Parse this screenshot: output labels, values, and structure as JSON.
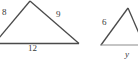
{
  "figure": {
    "kind": "geometry-diagram",
    "background_color": "#ffffff",
    "stroke_color": "#4a4a4a",
    "label_color": "#3a3a3a",
    "triangles": [
      {
        "name": "left-triangle",
        "labels": [
          {
            "id": "left-8",
            "text": "8",
            "side": "left",
            "style": "number"
          },
          {
            "id": "left-9",
            "text": "9",
            "side": "right",
            "style": "number"
          },
          {
            "id": "left-12",
            "text": "12",
            "side": "bottom",
            "style": "number"
          }
        ]
      },
      {
        "name": "right-triangle",
        "labels": [
          {
            "id": "right-6",
            "text": "6",
            "side": "left",
            "style": "number"
          },
          {
            "id": "right-y",
            "text": "y",
            "side": "bottom",
            "style": "variable"
          }
        ]
      }
    ]
  }
}
